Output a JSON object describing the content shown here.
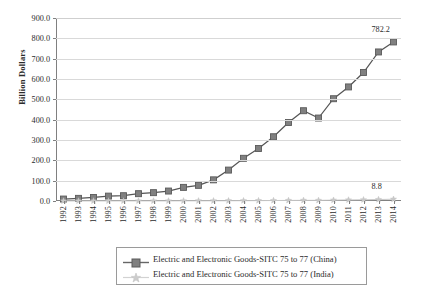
{
  "chart_data": {
    "type": "line",
    "title": "",
    "subtitle": "",
    "xlabel": "",
    "ylabel": "Billion Dollars",
    "x": [
      1992,
      1993,
      1994,
      1995,
      1996,
      1997,
      1998,
      1999,
      2000,
      2001,
      2002,
      2003,
      2004,
      2005,
      2006,
      2007,
      2008,
      2009,
      2010,
      2011,
      2012,
      2013,
      2014
    ],
    "categories": [
      "1992",
      "1993",
      "1994",
      "1995",
      "1996",
      "1997",
      "1998",
      "1999",
      "2000",
      "2001",
      "2002",
      "2003",
      "2004",
      "2005",
      "2006",
      "2007",
      "2008",
      "2009",
      "2010",
      "2011",
      "2012",
      "2013",
      "2014"
    ],
    "ylim": [
      0,
      900
    ],
    "yticks": [
      0,
      100,
      200,
      300,
      400,
      500,
      600,
      700,
      800,
      900
    ],
    "ytick_labels": [
      "0.0",
      "100.0",
      "200.0",
      "300.0",
      "400.0",
      "500.0",
      "600.0",
      "700.0",
      "800.0",
      "900.0"
    ],
    "grid": true,
    "legend_position": "bottom",
    "series": [
      {
        "name": "Electric and Electronic Goods-SITC 75 to 77 (China)",
        "color": "#808080",
        "marker": "square",
        "values": [
          9.6,
          13.0,
          17.4,
          24.0,
          26.0,
          36.0,
          41.0,
          49.0,
          67.0,
          77.0,
          104.0,
          152.0,
          210.0,
          258.0,
          316.0,
          386.0,
          444.0,
          408.0,
          503.0,
          561.0,
          632.0,
          733.0,
          782.2
        ]
      },
      {
        "name": "Electric and Electronic Goods-SITC 75 to 77 (India)",
        "color": "#c8c8c8",
        "marker": "star",
        "values": [
          0.2,
          0.2,
          0.3,
          0.3,
          0.4,
          0.4,
          0.4,
          0.5,
          0.8,
          0.8,
          1.0,
          1.2,
          1.5,
          1.9,
          2.3,
          2.8,
          3.3,
          3.1,
          4.2,
          5.2,
          6.0,
          7.2,
          8.8
        ]
      }
    ],
    "annotations": [
      {
        "name": "china-last-value",
        "text": "782.2",
        "series": "Electric and Electronic Goods-SITC 75 to 77 (China)",
        "x": 2014,
        "y": 782.2
      },
      {
        "name": "india-last-value",
        "text": "8.8",
        "series": "Electric and Electronic Goods-SITC 75 to 77 (India)",
        "x": 2014,
        "y": 8.8
      }
    ]
  },
  "legend": {
    "items": [
      {
        "label": "Electric and Electronic Goods-SITC 75 to 77 (China)",
        "color": "#808080"
      },
      {
        "label": "Electric and Electronic Goods-SITC 75 to 77 (India)",
        "color": "#c8c8c8"
      }
    ]
  },
  "colors": {
    "china": "#808080",
    "india": "#c8c8c8",
    "axis": "#808080",
    "grid": "#d9d9d9",
    "text": "#2b2b2b",
    "background": "#ffffff"
  }
}
